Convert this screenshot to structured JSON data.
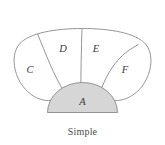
{
  "figure": {
    "caption": "Simple",
    "background_color": "#ffffff",
    "stroke_color": "#8a8a8a",
    "label_color": "#3a3a3a",
    "caption_color": "#4a4a4a"
  },
  "diagram": {
    "type": "region-partition-diagram",
    "outer_shape": "rounded-blob",
    "base_region": {
      "id": "A",
      "label": "A",
      "shape": "semicircular-dome",
      "fill_color": "#d6d6d6",
      "position": "bottom-center"
    },
    "regions": [
      {
        "id": "C",
        "label": "C",
        "position": "left-lobe",
        "fill_color": "#ffffff"
      },
      {
        "id": "D",
        "label": "D",
        "position": "upper-left-wedge",
        "fill_color": "#ffffff"
      },
      {
        "id": "E",
        "label": "E",
        "position": "upper-right-wedge",
        "fill_color": "#ffffff"
      },
      {
        "id": "F",
        "label": "F",
        "position": "right-lobe",
        "fill_color": "#ffffff"
      }
    ],
    "labels": {
      "A": "A",
      "C": "C",
      "D": "D",
      "E": "E",
      "F": "F"
    }
  }
}
